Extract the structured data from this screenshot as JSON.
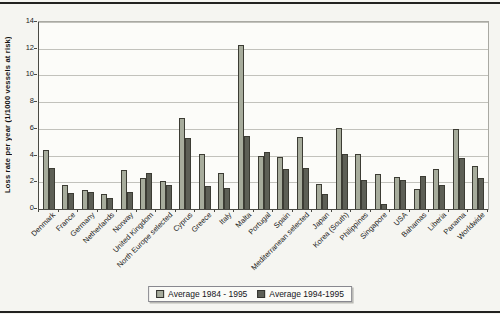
{
  "chart_data": {
    "type": "bar",
    "title": "",
    "xlabel": "",
    "ylabel": "Loss rate per year (1/1000 vessels at risk)",
    "ylim": [
      0,
      14
    ],
    "yticks": [
      0,
      2,
      4,
      6,
      8,
      10,
      12,
      14
    ],
    "grid": true,
    "legend_position": "bottom-center",
    "categories": [
      "Denmark",
      "France",
      "Germany",
      "Netherlands",
      "Norway",
      "United Kingdom",
      "North Europe selected",
      "Cyprus",
      "Greece",
      "Italy",
      "Malta",
      "Portugal",
      "Spain",
      "Mediterranean selected",
      "Japan",
      "Korea (South)",
      "Philippines",
      "Singapore",
      "USA",
      "Bahamas",
      "Liberia",
      "Panama",
      "Worldwide"
    ],
    "series": [
      {
        "name": "Average 1984 - 1995",
        "color": "#a7ac9c",
        "values": [
          4.4,
          1.8,
          1.4,
          1.1,
          2.9,
          2.3,
          2.1,
          6.8,
          4.1,
          2.7,
          12.3,
          4.0,
          3.9,
          5.4,
          1.9,
          6.1,
          4.1,
          2.6,
          2.4,
          1.5,
          3.0,
          6.0,
          3.2
        ]
      },
      {
        "name": "Average 1994-1995",
        "color": "#5d5f56",
        "values": [
          3.1,
          1.2,
          1.3,
          0.8,
          1.3,
          2.7,
          1.8,
          5.3,
          1.7,
          1.6,
          5.5,
          4.3,
          3.0,
          3.1,
          1.1,
          4.1,
          2.2,
          0.4,
          2.2,
          2.5,
          1.8,
          3.8,
          2.3
        ]
      }
    ]
  }
}
